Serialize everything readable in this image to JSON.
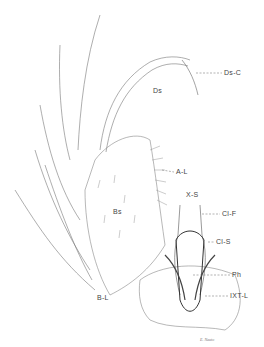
{
  "figure": {
    "labels": [
      {
        "id": "ds-c",
        "text": "Ds-C",
        "x": 224,
        "y": 71
      },
      {
        "id": "ds",
        "text": "Ds",
        "x": 153,
        "y": 89
      },
      {
        "id": "a-l",
        "text": "A-L",
        "x": 176,
        "y": 170
      },
      {
        "id": "bs",
        "text": "Bs",
        "x": 113,
        "y": 210
      },
      {
        "id": "x-s",
        "text": "X-S",
        "x": 186,
        "y": 193
      },
      {
        "id": "cl-f",
        "text": "Cl-F",
        "x": 222,
        "y": 212
      },
      {
        "id": "cl-s",
        "text": "Cl-S",
        "x": 216,
        "y": 240
      },
      {
        "id": "ph",
        "text": "Ph",
        "x": 232,
        "y": 273
      },
      {
        "id": "ixt-l",
        "text": "IXT-L",
        "x": 230,
        "y": 294
      },
      {
        "id": "b-l",
        "text": "B-L",
        "x": 97,
        "y": 296
      }
    ],
    "signature": "E. Nauto"
  }
}
